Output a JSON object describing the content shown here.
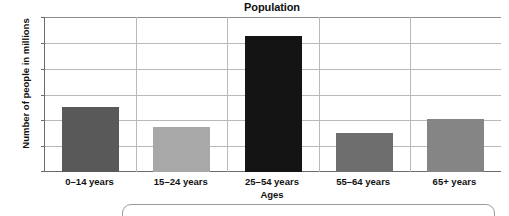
{
  "chart_data": {
    "type": "bar",
    "title": "Population",
    "xlabel": "Ages",
    "ylabel": "Number of people in millions",
    "categories": [
      "0–14 years",
      "15–24 years",
      "25–54 years",
      "55–64 years",
      "65+ years"
    ],
    "values": [
      5.0,
      3.5,
      10.5,
      3.0,
      4.1
    ],
    "bar_colors": [
      "#595959",
      "#a8a8a8",
      "#141414",
      "#6e6e6e",
      "#858585"
    ],
    "ylim": [
      0,
      12
    ],
    "yticks": [
      0,
      2,
      4,
      6,
      8,
      10,
      12
    ],
    "ytick_labels": [
      "0",
      "2",
      "4",
      "6",
      "8",
      "10",
      "12"
    ],
    "grid": "horizontal-and-category-separators",
    "legend": "none",
    "series": [
      {
        "name": "Population",
        "values": [
          5.0,
          3.5,
          10.5,
          3.0,
          4.1
        ]
      }
    ]
  },
  "callout": {
    "text": ""
  }
}
